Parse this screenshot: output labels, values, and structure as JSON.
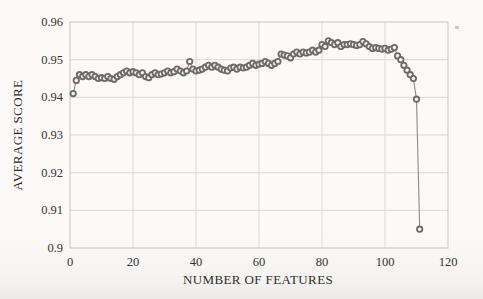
{
  "chart_data": {
    "type": "line",
    "title": "",
    "xlabel": "NUMBER OF FEATURES",
    "ylabel": "AVERAGE SCORE",
    "xlim": [
      0,
      120
    ],
    "ylim": [
      0.9,
      0.96
    ],
    "grid": true,
    "legend": "none",
    "x_tick_values": [
      0,
      20,
      40,
      60,
      80,
      100,
      120
    ],
    "x_tick_labels": [
      "0",
      "20",
      "40",
      "60",
      "80",
      "100",
      "120"
    ],
    "y_tick_values": [
      0.9,
      0.91,
      0.92,
      0.93,
      0.94,
      0.95,
      0.96
    ],
    "y_tick_labels": [
      "0.9",
      "0.91",
      "0.92",
      "0.93",
      "0.94",
      "0.95",
      "0.96"
    ],
    "marker": "open-circle",
    "series": [
      {
        "name": "average score vs number of features",
        "x": [
          1,
          2,
          3,
          4,
          5,
          6,
          7,
          8,
          9,
          10,
          11,
          12,
          13,
          14,
          15,
          16,
          17,
          18,
          19,
          20,
          21,
          22,
          23,
          24,
          25,
          26,
          27,
          28,
          29,
          30,
          31,
          32,
          33,
          34,
          35,
          36,
          37,
          38,
          39,
          40,
          41,
          42,
          43,
          44,
          45,
          46,
          47,
          48,
          49,
          50,
          51,
          52,
          53,
          54,
          55,
          56,
          57,
          58,
          59,
          60,
          61,
          62,
          63,
          64,
          65,
          66,
          67,
          68,
          69,
          70,
          71,
          72,
          73,
          74,
          75,
          76,
          77,
          78,
          79,
          80,
          81,
          82,
          83,
          84,
          85,
          86,
          87,
          88,
          89,
          90,
          91,
          92,
          93,
          94,
          95,
          96,
          97,
          98,
          99,
          100,
          101,
          102,
          103,
          104,
          105,
          106,
          107,
          108,
          109,
          110,
          111
        ],
        "y": [
          0.941,
          0.9445,
          0.946,
          0.9455,
          0.946,
          0.9455,
          0.946,
          0.9455,
          0.945,
          0.9452,
          0.945,
          0.9455,
          0.945,
          0.9448,
          0.9455,
          0.946,
          0.9465,
          0.947,
          0.9465,
          0.9468,
          0.9465,
          0.946,
          0.9465,
          0.9455,
          0.9452,
          0.946,
          0.9465,
          0.946,
          0.9462,
          0.9465,
          0.947,
          0.9465,
          0.9468,
          0.9475,
          0.947,
          0.9465,
          0.947,
          0.9495,
          0.9475,
          0.947,
          0.9472,
          0.9475,
          0.948,
          0.9485,
          0.948,
          0.9485,
          0.948,
          0.9475,
          0.9472,
          0.947,
          0.9478,
          0.948,
          0.9475,
          0.948,
          0.9478,
          0.948,
          0.9485,
          0.949,
          0.9485,
          0.9488,
          0.949,
          0.9495,
          0.949,
          0.9485,
          0.949,
          0.9495,
          0.9515,
          0.9512,
          0.951,
          0.9505,
          0.9515,
          0.952,
          0.9515,
          0.952,
          0.9518,
          0.952,
          0.9525,
          0.952,
          0.9525,
          0.954,
          0.9535,
          0.955,
          0.9545,
          0.954,
          0.9545,
          0.9535,
          0.954,
          0.954,
          0.9542,
          0.954,
          0.9538,
          0.954,
          0.9548,
          0.9542,
          0.9535,
          0.953,
          0.9532,
          0.953,
          0.9528,
          0.953,
          0.9525,
          0.9528,
          0.9532,
          0.951,
          0.95,
          0.9485,
          0.9472,
          0.946,
          0.945,
          0.9395,
          0.905
        ]
      }
    ],
    "colors": {
      "marker_stroke": "#6c6b69",
      "marker_fill": "#f4f3f1",
      "line": "#8b8a88",
      "grid": "#dbd9d6",
      "plot_border": "#cfcdca",
      "text": "#323130",
      "background": "#fbfaf9"
    }
  }
}
